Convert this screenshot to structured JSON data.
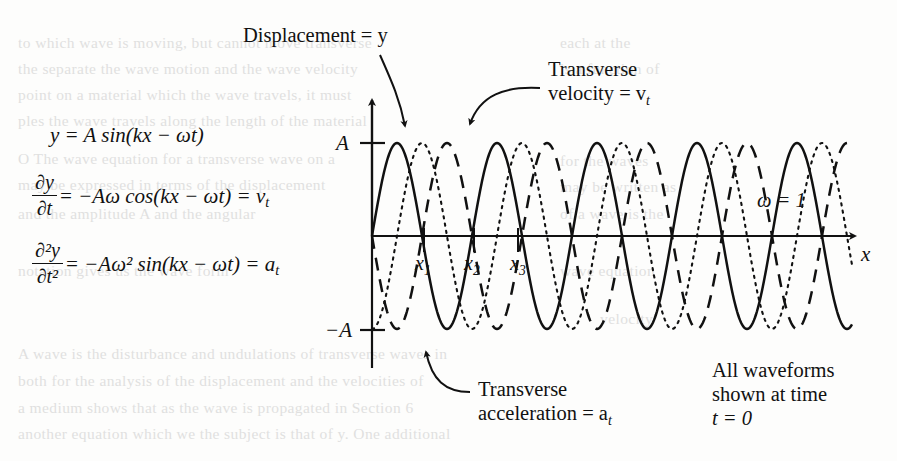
{
  "figure": {
    "title_none": "",
    "omega_note": "ω = 1",
    "x_axis_label": "x",
    "y_tick_top": "A",
    "y_tick_bottom": "−A"
  },
  "equations": {
    "displacement": "y = A sin(kx − ωt)",
    "velocity_num": "∂y",
    "velocity_den": "∂t",
    "velocity_rhs": "= −Aω cos(kx − ωt) = v",
    "velocity_sub": "t",
    "accel_num": "∂²y",
    "accel_den": "∂t²",
    "accel_rhs": "= −Aω² sin(kx − ωt) = a",
    "accel_sub": "t"
  },
  "callouts": {
    "displacement_label": "Displacement = y",
    "velocity_line1": "Transverse",
    "velocity_line2": "velocity = v",
    "velocity_sub": "t",
    "acceleration_line1": "Transverse",
    "acceleration_line2": "acceleration = a",
    "acceleration_sub": "t",
    "time_line1": "All waveforms",
    "time_line2": "shown at time",
    "time_line3": "t = 0"
  },
  "x_ticks": [
    {
      "label": "x",
      "sub": "1"
    },
    {
      "label": "x",
      "sub": "2"
    },
    {
      "label": "x",
      "sub": "3"
    }
  ],
  "ghost_text": [
    {
      "x": 18,
      "y": 34,
      "text": "to which wave is moving, but cannot move transverse"
    },
    {
      "x": 18,
      "y": 60,
      "text": "the separate the wave motion and the wave velocity"
    },
    {
      "x": 18,
      "y": 86,
      "text": "point on a material which the wave travels, it must"
    },
    {
      "x": 18,
      "y": 112,
      "text": "ples the wave travels along the length of the material"
    },
    {
      "x": 18,
      "y": 150,
      "text": "O The wave equation for a transverse wave on a"
    },
    {
      "x": 18,
      "y": 176,
      "text": "may be expressed in terms of the displacement"
    },
    {
      "x": 18,
      "y": 205,
      "text": "and the amplitude A and the angular"
    },
    {
      "x": 18,
      "y": 262,
      "text": "notation gives us the wave form"
    },
    {
      "x": 18,
      "y": 345,
      "text": "A wave is the disturbance and undulations of transverse waves in"
    },
    {
      "x": 18,
      "y": 372,
      "text": "both for the analysis of the displacement and the velocities of"
    },
    {
      "x": 18,
      "y": 399,
      "text": "a medium shows that as the wave is propagated in Section 6"
    },
    {
      "x": 18,
      "y": 425,
      "text": "another equation which we the subject is that of y. One additional"
    },
    {
      "x": 560,
      "y": 34,
      "text": "each at the"
    },
    {
      "x": 560,
      "y": 60,
      "text": "is a function of"
    },
    {
      "x": 560,
      "y": 152,
      "text": "for the waves"
    },
    {
      "x": 560,
      "y": 178,
      "text": "may be written as"
    },
    {
      "x": 560,
      "y": 205,
      "text": "of a wave is the"
    },
    {
      "x": 560,
      "y": 262,
      "text": "wave equation"
    },
    {
      "x": 600,
      "y": 310,
      "text": "velocity"
    }
  ],
  "chart_data": {
    "type": "line",
    "xlabel": "x",
    "ylabel": "",
    "xlim": [
      0,
      4.9
    ],
    "ylim": [
      -1.15,
      1.15
    ],
    "grid": false,
    "legend": "inline-callouts",
    "x_tick_values": [
      0.52,
      1.02,
      1.46
    ],
    "x_tick_labels": [
      "x₁",
      "x₂",
      "x₃"
    ],
    "y_tick_values": [
      1,
      -1
    ],
    "y_tick_labels": [
      "A",
      "−A"
    ],
    "parameters": {
      "A": 1,
      "omega": 1,
      "t": 0,
      "period_px": 100
    },
    "series": [
      {
        "name": "Displacement = y",
        "formula": "y = A sin(kx)",
        "style": "solid",
        "phase_deg": 0,
        "amplitude": 1,
        "color": "#111111"
      },
      {
        "name": "Transverse velocity = v_t",
        "formula": "v_t = −Aω cos(kx)",
        "style": "dotted",
        "phase_deg": -90,
        "amplitude": 1,
        "color": "#111111"
      },
      {
        "name": "Transverse acceleration = a_t",
        "formula": "a_t = −Aω² sin(kx)",
        "style": "dashed",
        "phase_deg": 180,
        "amplitude": 1,
        "color": "#111111"
      }
    ]
  }
}
